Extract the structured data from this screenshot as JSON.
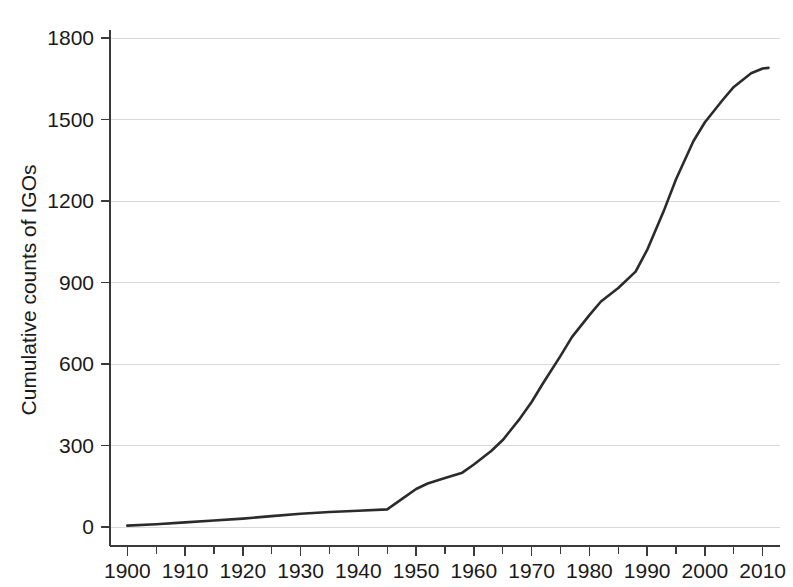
{
  "chart_data": {
    "type": "line",
    "title": "",
    "xlabel": "",
    "ylabel": "Cumulative counts of IGOs",
    "xlim": [
      1897,
      2013
    ],
    "ylim": [
      0,
      1860
    ],
    "grid": true,
    "legend": "none",
    "y_ticks": [
      0,
      300,
      600,
      900,
      1200,
      1500,
      1800
    ],
    "y_tick_labels": [
      "0",
      "300",
      "600",
      "900",
      "1200",
      "1500",
      "1800"
    ],
    "x_ticks": [
      1900,
      1910,
      1920,
      1930,
      1940,
      1950,
      1960,
      1970,
      1980,
      1990,
      2000,
      2010
    ],
    "x_tick_labels": [
      "1900",
      "1910",
      "1920",
      "1930",
      "1940",
      "1950",
      "1960",
      "1970",
      "1980",
      "1990",
      "2000",
      "2010"
    ],
    "x_minor_ticks": [
      1905,
      1915,
      1925,
      1935,
      1945,
      1955,
      1965,
      1975,
      1985,
      1995,
      2005
    ],
    "line_color": "#2b2b2b",
    "grid_color": "#d9d9d9",
    "axis_color": "#3a3a3a",
    "series": [
      {
        "name": "Cumulative counts of IGOs",
        "x": [
          1900,
          1905,
          1910,
          1915,
          1920,
          1925,
          1930,
          1935,
          1940,
          1945,
          1948,
          1950,
          1952,
          1955,
          1958,
          1960,
          1963,
          1965,
          1968,
          1970,
          1972,
          1975,
          1977,
          1980,
          1982,
          1985,
          1988,
          1990,
          1993,
          1995,
          1998,
          2000,
          2003,
          2005,
          2008,
          2010,
          2011
        ],
        "y": [
          5,
          10,
          17,
          24,
          31,
          40,
          49,
          55,
          60,
          65,
          110,
          140,
          160,
          180,
          200,
          230,
          280,
          320,
          400,
          460,
          530,
          630,
          700,
          780,
          830,
          880,
          940,
          1020,
          1170,
          1280,
          1420,
          1490,
          1570,
          1620,
          1670,
          1688,
          1690
        ]
      }
    ]
  }
}
